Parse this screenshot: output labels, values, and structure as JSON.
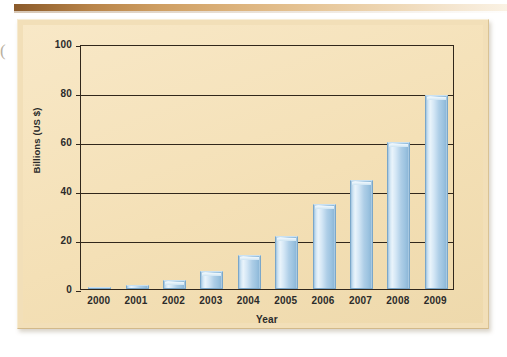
{
  "figure": {
    "background_color": "#f6e3bd",
    "frame_color": "#f2dfb8",
    "top_band_color": "#8a5a2b",
    "artifact_glyph": "("
  },
  "chart_data": {
    "type": "bar",
    "title": "",
    "subtitle": "",
    "xlabel": "Year",
    "ylabel": "Billions (US $)",
    "categories": [
      "2000",
      "2001",
      "2002",
      "2003",
      "2004",
      "2005",
      "2006",
      "2007",
      "2008",
      "2009"
    ],
    "values": [
      0.5,
      1.8,
      3.5,
      7.5,
      14,
      21.5,
      34.5,
      44.5,
      60,
      79
    ],
    "ylim": [
      0,
      100
    ],
    "xlim_categories": 10,
    "y_ticks": [
      0,
      20,
      40,
      60,
      80,
      100
    ],
    "y_tick_labels": [
      "0",
      "20",
      "40",
      "60",
      "80",
      "100"
    ],
    "x_tick_labels": [
      "2000",
      "2001",
      "2002",
      "2003",
      "2004",
      "2005",
      "2006",
      "2007",
      "2008",
      "2009"
    ],
    "grid": true,
    "grid_axis": "y",
    "legend": false,
    "legend_position": "none",
    "bar_color": "#aecee7",
    "bar_edge_color": "#7ba7c9",
    "axis_color": "#31271b",
    "annotations": []
  }
}
